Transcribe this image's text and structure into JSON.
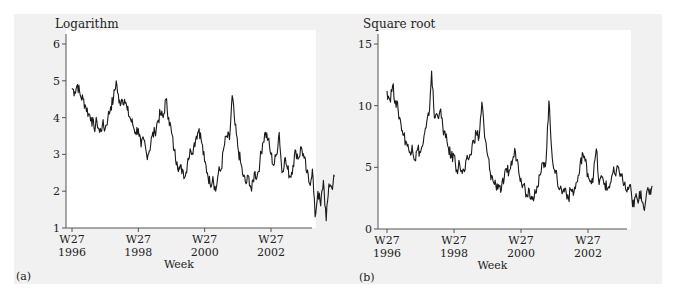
{
  "chart_data": [
    {
      "type": "line",
      "panel_label": "(a)",
      "title": "Logarithm",
      "xlabel": "Week",
      "ylabel": "",
      "ylim": [
        1,
        6
      ],
      "yticks": [
        1,
        2,
        3,
        4,
        5,
        6
      ],
      "xticks": [
        {
          "pos": 1996.5,
          "label1": "W27",
          "label2": "1996"
        },
        {
          "pos": 1998.5,
          "label1": "W27",
          "label2": "1998"
        },
        {
          "pos": 2000.5,
          "label1": "W27",
          "label2": "2000"
        },
        {
          "pos": 2002.5,
          "label1": "W27",
          "label2": "2002"
        }
      ],
      "xlim": [
        1996.3,
        2003.9
      ],
      "grid": false,
      "x_start": 1996.5,
      "x_step": 0.0833,
      "values": [
        4.8,
        4.7,
        4.9,
        4.6,
        4.5,
        4.3,
        4.1,
        4.0,
        3.7,
        3.9,
        3.6,
        3.8,
        3.7,
        4.0,
        4.3,
        4.5,
        5.0,
        4.4,
        4.5,
        4.5,
        4.2,
        4.0,
        3.8,
        3.6,
        3.7,
        3.2,
        3.4,
        3.0,
        3.1,
        3.5,
        3.6,
        3.9,
        4.1,
        4.0,
        4.5,
        4.0,
        3.6,
        3.1,
        2.8,
        2.6,
        2.6,
        2.4,
        2.9,
        3.1,
        3.2,
        3.5,
        3.7,
        3.3,
        2.8,
        2.5,
        2.2,
        2.4,
        2.0,
        2.5,
        2.6,
        3.2,
        3.5,
        3.4,
        4.6,
        3.8,
        3.2,
        2.8,
        2.4,
        2.2,
        2.4,
        2.0,
        2.5,
        2.4,
        2.8,
        3.3,
        3.6,
        3.4,
        3.0,
        2.7,
        3.0,
        3.6,
        2.5,
        2.9,
        2.6,
        2.4,
        2.7,
        3.1,
        2.9,
        3.2,
        2.9,
        2.5,
        2.2,
        2.6,
        1.3,
        2.0,
        1.6,
        2.3,
        1.2,
        2.2,
        2.1,
        2.4
      ]
    },
    {
      "type": "line",
      "panel_label": "(b)",
      "title": "Square root",
      "xlabel": "Week",
      "ylabel": "",
      "ylim": [
        0,
        15
      ],
      "yticks": [
        0,
        5,
        10,
        15
      ],
      "xticks": [
        {
          "pos": 1996.5,
          "label1": "W27",
          "label2": "1996"
        },
        {
          "pos": 1998.5,
          "label1": "W27",
          "label2": "1998"
        },
        {
          "pos": 2000.5,
          "label1": "W27",
          "label2": "2000"
        },
        {
          "pos": 2002.5,
          "label1": "W27",
          "label2": "2002"
        }
      ],
      "xlim": [
        1996.3,
        2003.9
      ],
      "grid": false,
      "x_start": 1996.5,
      "x_step": 0.0833,
      "values": [
        11.2,
        10.5,
        11.6,
        10.4,
        9.6,
        8.5,
        7.6,
        7.0,
        6.2,
        6.8,
        5.6,
        6.5,
        6.2,
        7.0,
        8.2,
        9.2,
        12.8,
        9.0,
        9.3,
        9.6,
        8.3,
        7.4,
        6.6,
        5.8,
        6.0,
        4.8,
        5.3,
        4.5,
        4.8,
        5.7,
        6.0,
        7.2,
        7.8,
        7.4,
        10.3,
        7.4,
        6.0,
        4.6,
        3.9,
        3.6,
        3.6,
        3.2,
        4.1,
        4.6,
        4.8,
        5.6,
        6.3,
        5.2,
        4.1,
        3.6,
        2.8,
        3.2,
        2.4,
        3.2,
        3.4,
        4.4,
        5.4,
        5.6,
        10.4,
        6.5,
        4.8,
        4.0,
        3.3,
        3.0,
        3.3,
        2.5,
        3.2,
        3.0,
        3.8,
        4.6,
        6.2,
        5.5,
        4.5,
        3.9,
        4.4,
        6.5,
        3.6,
        4.2,
        3.7,
        3.2,
        3.7,
        4.6,
        4.3,
        5.0,
        4.3,
        3.6,
        3.0,
        3.6,
        1.8,
        2.6,
        2.1,
        3.1,
        1.7,
        2.9,
        2.8,
        3.5
      ]
    }
  ]
}
